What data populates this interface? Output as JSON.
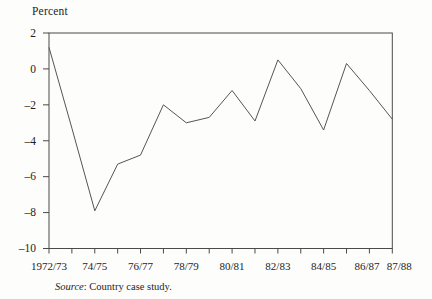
{
  "chart_data": {
    "type": "line",
    "title": "Percent",
    "x": [
      "1972/73",
      "1973/74",
      "1974/75",
      "1975/76",
      "1976/77",
      "1977/78",
      "1978/79",
      "1979/80",
      "1980/81",
      "1981/82",
      "1982/83",
      "1983/84",
      "1984/85",
      "1985/86",
      "1986/87",
      "1987/88"
    ],
    "values": [
      1.2,
      -3.3,
      -7.9,
      -5.3,
      -4.8,
      -2.0,
      -3.0,
      -2.7,
      -1.2,
      -2.9,
      0.5,
      -1.1,
      -3.4,
      0.3,
      -1.2,
      -2.8
    ],
    "x_tick_labels_shown": [
      {
        "label": "1972/73",
        "index": 0
      },
      {
        "label": "74/75",
        "index": 2
      },
      {
        "label": "76/77",
        "index": 4
      },
      {
        "label": "78/79",
        "index": 6
      },
      {
        "label": "80/81",
        "index": 8
      },
      {
        "label": "82/83",
        "index": 10
      },
      {
        "label": "84/85",
        "index": 12
      },
      {
        "label": "86/87",
        "index": 14
      },
      {
        "label": "87/88",
        "index": 15
      }
    ],
    "y_ticks": [
      2,
      0,
      -2,
      -4,
      -6,
      -8,
      -10
    ],
    "ylim": [
      -10,
      2
    ],
    "xlabel": "",
    "ylabel": "Percent",
    "grid": false,
    "legend": "none",
    "line_color": "#555555",
    "frame_color": "#4a4a4a",
    "source_prefix": "Source",
    "source_rest": ": Country case study."
  }
}
